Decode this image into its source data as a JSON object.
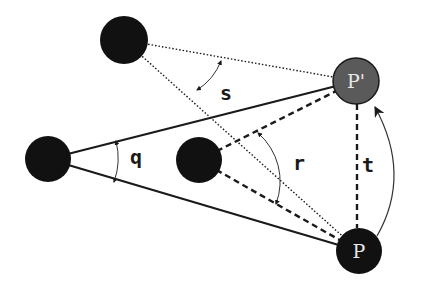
{
  "diagram": {
    "colors": {
      "node_dark": "#111111",
      "node_highlight": "#5a5a5a",
      "line": "#1a1a1a",
      "node_label": "#e8e8e8",
      "background": "#ffffff"
    },
    "nodes": [
      {
        "id": "top",
        "label": "",
        "cx": 124,
        "cy": 40,
        "r": 24,
        "fill": "dark"
      },
      {
        "id": "left",
        "label": "",
        "cx": 48,
        "cy": 159,
        "r": 23,
        "fill": "dark"
      },
      {
        "id": "middle",
        "label": "",
        "cx": 199,
        "cy": 160,
        "r": 23,
        "fill": "dark"
      },
      {
        "id": "p_prime",
        "label": "P'",
        "cx": 356,
        "cy": 81,
        "r": 23,
        "fill": "highlight"
      },
      {
        "id": "p",
        "label": "P",
        "cx": 359,
        "cy": 251,
        "r": 23,
        "fill": "dark"
      }
    ],
    "edges": [
      {
        "from": "left",
        "to": "p_prime",
        "style": "solid"
      },
      {
        "from": "left",
        "to": "p",
        "style": "solid"
      },
      {
        "from": "top",
        "to": "p_prime",
        "style": "dotted"
      },
      {
        "from": "top",
        "to": "p",
        "style": "dotted"
      },
      {
        "from": "middle",
        "to": "p_prime",
        "style": "dashed"
      },
      {
        "from": "middle",
        "to": "p",
        "style": "dashed"
      },
      {
        "from": "p",
        "to": "p_prime",
        "style": "dashed"
      }
    ],
    "angle_labels": {
      "q": "q",
      "r": "r",
      "s": "s",
      "t": "t"
    },
    "node_labels": {
      "p_prime": "P'",
      "p": "P"
    }
  }
}
